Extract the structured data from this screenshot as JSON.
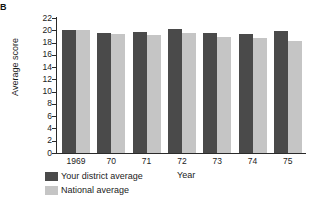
{
  "figure": {
    "label": "B"
  },
  "chart_data": {
    "type": "bar",
    "title": "",
    "xlabel": "Year",
    "ylabel": "Average score",
    "categories": [
      "1969",
      "70",
      "71",
      "72",
      "73",
      "74",
      "75"
    ],
    "series": [
      {
        "name": "Your district average",
        "color": "#4a4a4a",
        "values": [
          20.0,
          19.5,
          19.8,
          20.2,
          19.5,
          19.4,
          19.9
        ]
      },
      {
        "name": "National average",
        "color": "#c5c5c5",
        "values": [
          20.0,
          19.4,
          19.2,
          19.5,
          18.9,
          18.8,
          18.2
        ]
      }
    ],
    "ylim": [
      0,
      22
    ],
    "yticks": [
      0,
      2,
      4,
      6,
      8,
      10,
      12,
      14,
      16,
      18,
      20,
      22
    ],
    "grid": false,
    "legend_position": "bottom-left"
  },
  "legend": {
    "entries": [
      {
        "label": "Your district average",
        "color": "#4a4a4a"
      },
      {
        "label": "National average",
        "color": "#c5c5c5"
      }
    ]
  }
}
